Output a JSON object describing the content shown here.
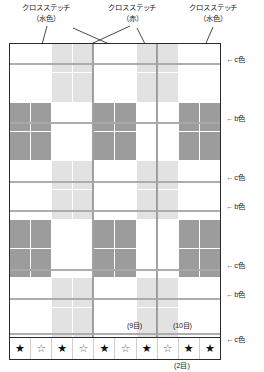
{
  "annotations": {
    "top_left": {
      "line1": "クロスステッチ",
      "line2": "（水色）"
    },
    "top_mid": {
      "line1": "クロスステッチ",
      "line2": "（赤）"
    },
    "top_right": {
      "line1": "クロスステッチ",
      "line2": "（水色）"
    }
  },
  "row_labels": [
    {
      "arrow": "←",
      "text": "c色"
    },
    {
      "arrow": "←",
      "text": "b色"
    },
    {
      "arrow": "←",
      "text": "c色"
    },
    {
      "arrow": "←",
      "text": "b色"
    },
    {
      "arrow": "←",
      "text": "c色"
    },
    {
      "arrow": "←",
      "text": "b色"
    },
    {
      "arrow": "←",
      "text": "c色"
    }
  ],
  "counts": {
    "col9": "(9目)",
    "col10": "(10目)",
    "bottom": "(2目)"
  },
  "stars": [
    {
      "glyph": "★",
      "filled": true
    },
    {
      "glyph": "☆",
      "filled": false
    },
    {
      "glyph": "★",
      "filled": true
    },
    {
      "glyph": "☆",
      "filled": false
    },
    {
      "glyph": "★",
      "filled": true
    },
    {
      "glyph": "☆",
      "filled": false
    },
    {
      "glyph": "★",
      "filled": true
    },
    {
      "glyph": "☆",
      "filled": false
    },
    {
      "glyph": "★",
      "filled": true
    },
    {
      "glyph": "★",
      "filled": true
    }
  ],
  "colors": {
    "white": "#ffffff",
    "light_gray": "#e2e2e2",
    "dark_gray": "#9c9c9c",
    "border": "#2b2b2b",
    "rule": "#b8b8b8"
  },
  "chart_data": {
    "type": "heatmap",
    "title": "",
    "xlabel": "",
    "ylabel": "",
    "columns": 10,
    "rows": 10,
    "legend": [
      "白 (white)",
      "c色 / 水色 (light)",
      "b色 / 赤 (dark)"
    ],
    "column_kinds": [
      "w",
      "w",
      "l",
      "l",
      "w",
      "w",
      "l",
      "l",
      "w",
      "w"
    ],
    "row_kinds": [
      "l",
      "l",
      "d",
      "d",
      "l",
      "l",
      "d",
      "d",
      "l",
      "l"
    ],
    "grid": [
      [
        "w",
        "w",
        "l",
        "l",
        "w",
        "w",
        "l",
        "l",
        "w",
        "w"
      ],
      [
        "w",
        "w",
        "l",
        "l",
        "w",
        "w",
        "l",
        "l",
        "w",
        "w"
      ],
      [
        "d",
        "d",
        "w",
        "w",
        "d",
        "d",
        "w",
        "w",
        "d",
        "d"
      ],
      [
        "d",
        "d",
        "w",
        "w",
        "d",
        "d",
        "w",
        "w",
        "d",
        "d"
      ],
      [
        "w",
        "w",
        "l",
        "l",
        "w",
        "w",
        "l",
        "l",
        "w",
        "w"
      ],
      [
        "w",
        "w",
        "l",
        "l",
        "w",
        "w",
        "l",
        "l",
        "w",
        "w"
      ],
      [
        "d",
        "d",
        "w",
        "w",
        "d",
        "d",
        "w",
        "w",
        "d",
        "d"
      ],
      [
        "d",
        "d",
        "w",
        "w",
        "d",
        "d",
        "w",
        "w",
        "d",
        "d"
      ],
      [
        "w",
        "w",
        "l",
        "l",
        "w",
        "w",
        "l",
        "l",
        "w",
        "w"
      ],
      [
        "w",
        "w",
        "l",
        "l",
        "w",
        "w",
        "l",
        "l",
        "w",
        "w"
      ]
    ]
  }
}
